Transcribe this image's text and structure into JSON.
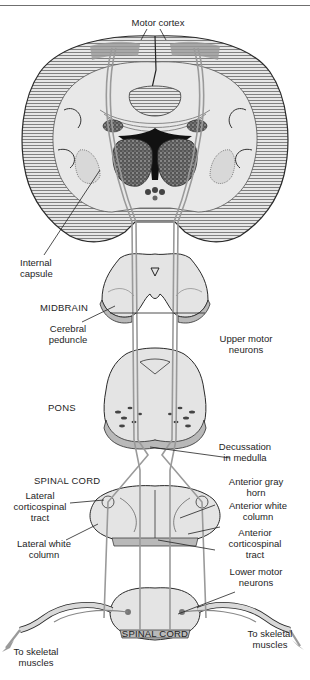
{
  "figure": {
    "title": "Motor cortex",
    "labels": {
      "motor_cortex": "Motor cortex",
      "internal_capsule": "Internal\ncapsule",
      "midbrain": "MIDBRAIN",
      "cerebral_peduncle": "Cerebral\npeduncle",
      "upper_motor_neurons": "Upper motor\nneurons",
      "pons": "PONS",
      "decussation": "Decussation\nin medulla",
      "spinal_cord_upper": "SPINAL CORD",
      "anterior_gray_horn": "Anterior gray\nhorn",
      "lateral_corticospinal_tract": "Lateral\ncorticospinal\ntract",
      "anterior_white_column": "Anterior white\ncolumn",
      "anterior_corticospinal_tract": "Anterior\ncorticospinal\ntract",
      "lateral_white_column": "Lateral white\ncolumn",
      "lower_motor_neurons": "Lower motor\nneurons",
      "spinal_cord_lower": "SPINAL CORD",
      "skeletal_left": "To skeletal\nmuscles",
      "skeletal_right": "To skeletal\nmuscles"
    },
    "colors": {
      "tissue": "#e4e4e4",
      "tissue_dark": "#b9b9b9",
      "tract": "#9a9a9a",
      "outline": "#2a2a2a",
      "hatch": "#6a6a6a",
      "nucleus": "#3a3a3a"
    }
  }
}
